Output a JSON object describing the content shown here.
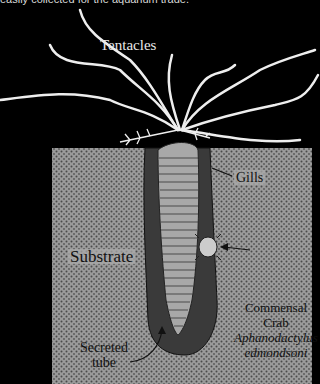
{
  "caption": "easily collected for the aquarium trade.",
  "labels": {
    "tentacles": "Tentacles",
    "gills": "Gills",
    "substrate": "Substrate",
    "commensal_line1": "Commensal",
    "commensal_line2": "Crab",
    "species_line1": "Aphanodactylus",
    "species_line2": "edmondsoni",
    "tube_line1": "Secreted",
    "tube_line2": "tube"
  },
  "colors": {
    "background": "#000000",
    "substrate": "#9a9a9a",
    "tube": "#3a3a3a",
    "worm": "#a8a8a8",
    "tentacle": "#eeeeee"
  }
}
